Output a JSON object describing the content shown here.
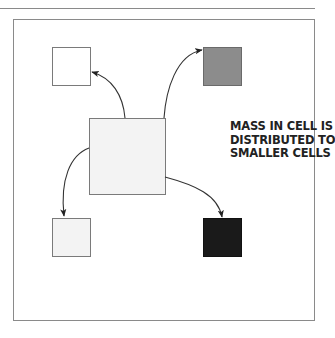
{
  "caption": {
    "lines": [
      "MASS IN CELL IS",
      "DISTRIBUTED TO",
      "SMALLER CELLS"
    ]
  },
  "colors": {
    "frame": "#8a8a8a",
    "parent_cell": "#f3f3f3",
    "cell_white": "#ffffff",
    "cell_light": "#f3f3f3",
    "cell_grey": "#8c8c8c",
    "cell_black": "#1a1a1a",
    "arrow": "#333333"
  },
  "cells": [
    {
      "id": "parent",
      "label": "large cell",
      "fill": "#f3f3f3"
    },
    {
      "id": "top-left",
      "label": "small cell white",
      "fill": "#ffffff"
    },
    {
      "id": "top-right",
      "label": "small cell grey",
      "fill": "#8c8c8c"
    },
    {
      "id": "bottom-left",
      "label": "small cell light",
      "fill": "#f3f3f3"
    },
    {
      "id": "bottom-right",
      "label": "small cell black",
      "fill": "#1a1a1a"
    }
  ]
}
